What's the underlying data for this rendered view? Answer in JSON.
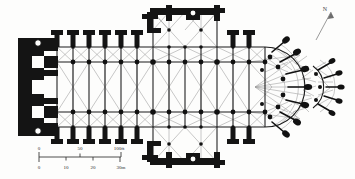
{
  "figure": {
    "background_color": "#fdfdfc",
    "ink_color": "#111111",
    "rib_color": "#8c8c8c",
    "wall_color": "#161616"
  },
  "north_indicator": {
    "label": "N",
    "name": "north-arrow"
  },
  "scale_bar": {
    "imperial": {
      "unit": "ft",
      "ticks": [
        "0",
        "50",
        "100ft"
      ],
      "tick_values": [
        0,
        50,
        100
      ]
    },
    "metric": {
      "unit": "m",
      "ticks": [
        "0",
        "10",
        "20",
        "30m"
      ],
      "tick_values": [
        0,
        10,
        20,
        30
      ]
    }
  },
  "plan_parts": [
    {
      "id": "west-front",
      "label": "West front with twin towers"
    },
    {
      "id": "nave",
      "label": "Nave with side aisles"
    },
    {
      "id": "north-transept",
      "label": "North transept"
    },
    {
      "id": "south-transept",
      "label": "South transept"
    },
    {
      "id": "crossing",
      "label": "Crossing"
    },
    {
      "id": "choir",
      "label": "Choir"
    },
    {
      "id": "chevet",
      "label": "Chevet with radiating chapels"
    },
    {
      "id": "flying-buttresses",
      "label": "Flying buttresses"
    }
  ]
}
